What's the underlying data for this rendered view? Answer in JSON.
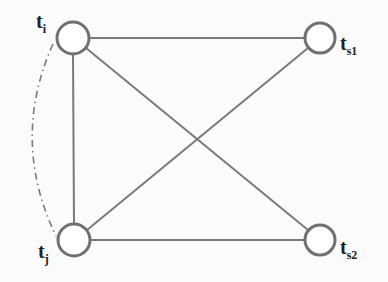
{
  "diagram": {
    "type": "graph",
    "nodes": [
      {
        "id": "ti",
        "base": "t",
        "sub": "i",
        "x": 73,
        "y": 38
      },
      {
        "id": "ts1",
        "base": "t",
        "sub": "s1",
        "x": 320,
        "y": 38
      },
      {
        "id": "tj",
        "base": "t",
        "sub": "j",
        "x": 74,
        "y": 240
      },
      {
        "id": "ts2",
        "base": "t",
        "sub": "s2",
        "x": 320,
        "y": 240
      }
    ],
    "edges": [
      {
        "from": "ti",
        "to": "ts1",
        "style": "solid"
      },
      {
        "from": "ti",
        "to": "tj",
        "style": "solid"
      },
      {
        "from": "ti",
        "to": "ts2",
        "style": "solid"
      },
      {
        "from": "tj",
        "to": "ts1",
        "style": "solid"
      },
      {
        "from": "tj",
        "to": "ts2",
        "style": "solid"
      },
      {
        "from": "ti",
        "to": "tj",
        "style": "dash-dot-curve"
      }
    ],
    "colors": {
      "stroke": "#7a7a7a",
      "node_stroke": "#707070",
      "label": "#222222"
    }
  }
}
